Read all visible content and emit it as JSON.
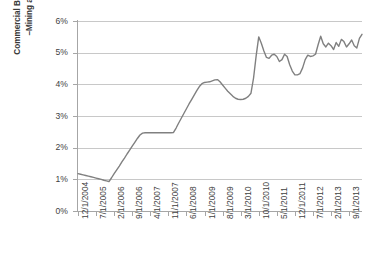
{
  "chart_data": {
    "type": "line",
    "title": "",
    "ylabel": "Commercial Banks: Loans and Advances to Residents –Mining as a percentage of total to Business Enterprises",
    "xlabel": "",
    "ylim": [
      0,
      6
    ],
    "y_tick_labels": [
      "0%",
      "1%",
      "2%",
      "3%",
      "4%",
      "5%",
      "6%"
    ],
    "y_tick_values": [
      0,
      1,
      2,
      3,
      4,
      5,
      6
    ],
    "grid": true,
    "legend": "none",
    "series_color": "#808080",
    "x_tick_labels": [
      "12/1/2004",
      "7/1/2005",
      "2/1/2006",
      "9/1/2006",
      "4/1/2007",
      "11/1/2007",
      "6/1/2008",
      "1/1/2009",
      "8/1/2009",
      "3/1/2010",
      "10/1/2010",
      "5/1/2011",
      "12/1/2011",
      "7/1/2012",
      "2/1/2013",
      "9/1/2013"
    ],
    "x_tick_indices": [
      0,
      7,
      14,
      21,
      28,
      35,
      42,
      49,
      56,
      63,
      70,
      77,
      84,
      91,
      98,
      105
    ],
    "x_start": "12/1/2004",
    "x_step_months": 1,
    "n_points": 111,
    "values": [
      1.18,
      1.16,
      1.14,
      1.12,
      1.1,
      1.08,
      1.06,
      1.04,
      1.02,
      1.0,
      0.97,
      0.95,
      0.93,
      1.05,
      1.18,
      1.3,
      1.42,
      1.55,
      1.67,
      1.8,
      1.92,
      2.05,
      2.17,
      2.29,
      2.4,
      2.46,
      2.47,
      2.47,
      2.47,
      2.47,
      2.47,
      2.47,
      2.47,
      2.47,
      2.47,
      2.47,
      2.47,
      2.48,
      2.62,
      2.78,
      2.93,
      3.08,
      3.23,
      3.38,
      3.52,
      3.66,
      3.8,
      3.93,
      4.02,
      4.06,
      4.07,
      4.08,
      4.11,
      4.14,
      4.15,
      4.08,
      3.98,
      3.88,
      3.78,
      3.7,
      3.62,
      3.56,
      3.53,
      3.52,
      3.53,
      3.56,
      3.62,
      3.72,
      4.2,
      4.9,
      5.5,
      5.3,
      5.05,
      4.85,
      4.82,
      4.92,
      4.95,
      4.88,
      4.72,
      4.78,
      4.95,
      4.88,
      4.62,
      4.42,
      4.3,
      4.3,
      4.34,
      4.52,
      4.78,
      4.92,
      4.88,
      4.9,
      4.95,
      5.25,
      5.52,
      5.28,
      5.18,
      5.3,
      5.22,
      5.1,
      5.32,
      5.2,
      5.42,
      5.35,
      5.18,
      5.28,
      5.4,
      5.22,
      5.15,
      5.45,
      5.58
    ]
  }
}
